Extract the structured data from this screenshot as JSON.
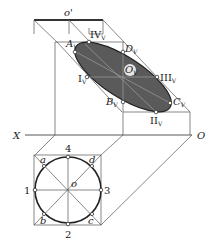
{
  "diagram": {
    "type": "descriptive-geometry-projection",
    "colors": {
      "ellipse_fill": "#5a5a5a",
      "line": "#555555",
      "thick_line": "#333333",
      "background": "#ffffff"
    },
    "top_view_line": {
      "label": "o'"
    },
    "axis": {
      "left_label": "X",
      "right_label": "O"
    },
    "auxiliary_view": {
      "center_label": "OV",
      "points": [
        {
          "name": "AV",
          "label": "A",
          "sub": "V"
        },
        {
          "name": "IVV",
          "label": "IV",
          "sub": "V"
        },
        {
          "name": "DV",
          "label": "D",
          "sub": "V"
        },
        {
          "name": "IV",
          "label": "I",
          "sub": "V"
        },
        {
          "name": "IIIV",
          "label": "III",
          "sub": "V"
        },
        {
          "name": "BV",
          "label": "B",
          "sub": "V"
        },
        {
          "name": "CV",
          "label": "C",
          "sub": "V"
        },
        {
          "name": "IIV",
          "label": "II",
          "sub": "V"
        }
      ]
    },
    "circle_view": {
      "center_label": "o",
      "numbers": {
        "top": "4",
        "left": "1",
        "right": "3",
        "bottom": "2"
      },
      "corners": {
        "top_left": "a",
        "top_right": "d",
        "bottom_left": "b",
        "bottom_right": "c"
      }
    }
  }
}
